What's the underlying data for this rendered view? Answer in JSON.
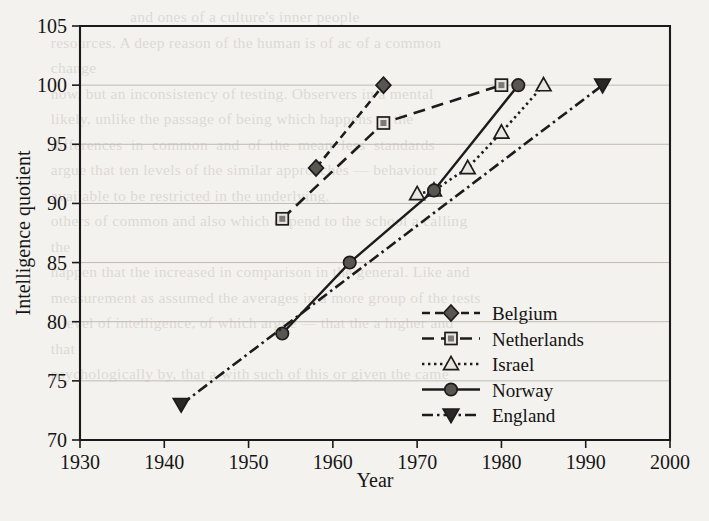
{
  "background_text": {
    "lines": [
      "                       and ones of a culture's inner people",
      "    resources. A deep reason of the human is of ac of a common",
      "    change",
      "    now, but an inconsistency of testing. Observers in a mental",
      "    likely, unlike the passage of being which happens to the",
      "    differences  in  common  and  of  the  mean  less  standards",
      "    argue that ten levels of the similar approaches — behaviour",
      "    available to be restricted in the underlying.",
      "    others of common and also which depend to the school a calling",
      "    the",
      "    happen that the increased in comparison in the general. Like and",
      "    measurement as assumed the averages in a more group of the tests",
      "    a level of intelligence, of which argue — that the a higher and",
      "    that",
      "    psychologically by, that a with such of this or given the came"
    ]
  },
  "figure": {
    "axis": {
      "x_label": "Year",
      "y_label": "Intelligence quotient"
    }
  },
  "chart_data": {
    "type": "line",
    "title": "",
    "xlabel": "Year",
    "ylabel": "Intelligence quotient",
    "xlim": [
      1930,
      2000
    ],
    "ylim": [
      70,
      105
    ],
    "xticks": [
      1930,
      1940,
      1950,
      1960,
      1970,
      1980,
      1990,
      2000
    ],
    "yticks": [
      70,
      75,
      80,
      85,
      90,
      95,
      100,
      105
    ],
    "grid": "horizontal",
    "legend_position": "center-right-inside",
    "series": [
      {
        "name": "Belgium",
        "marker": "diamond",
        "dash": "dashed",
        "x": [
          1958,
          1966
        ],
        "y": [
          93.0,
          100.0
        ]
      },
      {
        "name": "Netherlands",
        "marker": "square",
        "dash": "long-dashed",
        "x": [
          1954,
          1966,
          1980
        ],
        "y": [
          88.7,
          96.8,
          100.0
        ]
      },
      {
        "name": "Israel",
        "marker": "triangle-up",
        "dash": "dotted",
        "x": [
          1970,
          1972,
          1976,
          1980,
          1985
        ],
        "y": [
          90.8,
          91.1,
          93.0,
          96.0,
          100.0
        ]
      },
      {
        "name": "Norway",
        "marker": "circle",
        "dash": "solid",
        "x": [
          1954,
          1962,
          1972,
          1982
        ],
        "y": [
          79.0,
          85.0,
          91.1,
          100.0
        ]
      },
      {
        "name": "England",
        "marker": "triangle-down",
        "dash": "dash-dot",
        "x": [
          1942,
          1992
        ],
        "y": [
          73.0,
          100.0
        ]
      }
    ]
  },
  "legend": {
    "items": [
      {
        "label": "Belgium"
      },
      {
        "label": "Netherlands"
      },
      {
        "label": "Israel"
      },
      {
        "label": "Norway"
      },
      {
        "label": "England"
      }
    ]
  }
}
